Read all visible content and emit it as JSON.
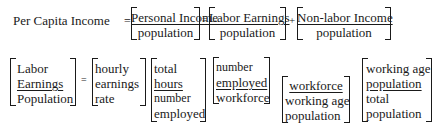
{
  "row1": {
    "lhs": "Per Capita Income",
    "eq1": "=",
    "term1": {
      "numerator": "Personal Income",
      "denominator": "population"
    },
    "eq2": "=",
    "term2": {
      "numerator": "Labor Earnings",
      "denominator": "population"
    },
    "plus": "+",
    "term3": {
      "numerator": "Non-labor Income",
      "denominator": "population"
    }
  },
  "row2": {
    "lhs": {
      "lines": [
        "Labor",
        "Earnings",
        "Population"
      ]
    },
    "eq": "=",
    "factors": [
      {
        "lines": [
          "hourly",
          "earnings",
          "rate"
        ]
      },
      {
        "lines": [
          "total",
          "hours",
          "number",
          "employed"
        ]
      },
      {
        "lines": [
          "number",
          "employed",
          "workforce"
        ]
      },
      {
        "lines": [
          "workforce",
          "working age",
          "population"
        ]
      },
      {
        "lines": [
          "working age",
          "population",
          "total",
          "population"
        ]
      }
    ]
  }
}
